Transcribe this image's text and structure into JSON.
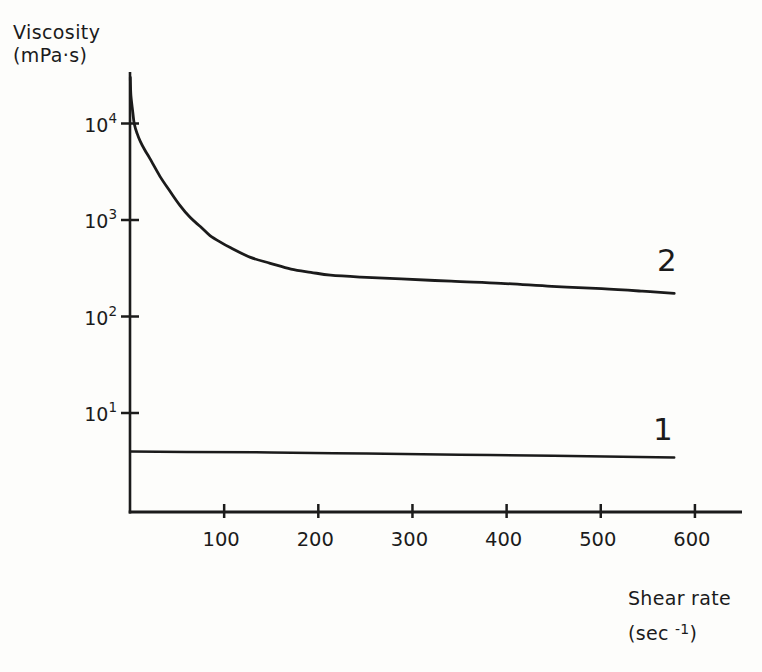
{
  "figure": {
    "background": "#fdfdfb",
    "ink": "#1b1b1b"
  },
  "chart_data": {
    "type": "line",
    "title": "",
    "grid": false,
    "legend": "inline-curve-labels",
    "x_axis": {
      "title_line1": "Shear rate",
      "unit_prefix": "(sec ",
      "unit_sup": "-1",
      "unit_suffix": ")",
      "scale": "linear",
      "range": [
        0,
        650
      ],
      "ticks": [
        100,
        200,
        300,
        400,
        500,
        600
      ]
    },
    "y_axis": {
      "title_line1": "Viscosity",
      "title_line2": "(mPa·s)",
      "scale": "log",
      "range": [
        1,
        34000
      ],
      "ticks": [
        {
          "base": "10",
          "exp": "4",
          "value": 10000
        },
        {
          "base": "10",
          "exp": "3",
          "value": 1000
        },
        {
          "base": "10",
          "exp": "2",
          "value": 100
        },
        {
          "base": "10",
          "exp": "1",
          "value": 10
        }
      ]
    },
    "series": [
      {
        "label": "1",
        "name": "curve-1-newtonian",
        "stroke_width": 2.5,
        "points": [
          [
            0.3,
            4.0
          ],
          [
            60,
            3.95
          ],
          [
            150,
            3.9
          ],
          [
            250,
            3.8
          ],
          [
            350,
            3.7
          ],
          [
            450,
            3.6
          ],
          [
            578,
            3.45
          ]
        ]
      },
      {
        "label": "2",
        "name": "curve-2-shear-thinning",
        "stroke_width": 2.8,
        "points": [
          [
            0.3,
            30000
          ],
          [
            1,
            19500
          ],
          [
            3,
            13000
          ],
          [
            4.5,
            10000
          ],
          [
            7.5,
            7900
          ],
          [
            11,
            6500
          ],
          [
            16,
            5250
          ],
          [
            21,
            4350
          ],
          [
            32,
            2820
          ],
          [
            43,
            1950
          ],
          [
            53,
            1420
          ],
          [
            64,
            1060
          ],
          [
            75,
            850
          ],
          [
            85,
            690
          ],
          [
            96,
            590
          ],
          [
            107,
            515
          ],
          [
            128,
            410
          ],
          [
            149,
            356
          ],
          [
            171,
            310
          ],
          [
            192,
            287
          ],
          [
            213,
            268
          ],
          [
            245,
            256
          ],
          [
            288,
            245
          ],
          [
            341,
            232
          ],
          [
            394,
            221
          ],
          [
            448,
            205
          ],
          [
            501,
            194
          ],
          [
            544,
            183
          ],
          [
            578,
            174
          ]
        ]
      }
    ]
  }
}
